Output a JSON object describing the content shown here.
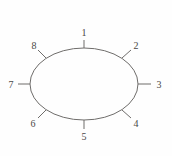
{
  "figure": {
    "name": "labelled-ellipse-diagram",
    "background_color": "#fefefe",
    "stroke_color": "#6f6d6b",
    "label_color": "#4a4846",
    "ellipse": {
      "center_x": 84,
      "center_y": 84,
      "radius_x": 54,
      "radius_y": 36,
      "stroke_width": 1,
      "fill": "none"
    },
    "labels": [
      {
        "id": "1",
        "text": "1",
        "angle_deg": 90,
        "position": "top",
        "label_x": 84,
        "label_y": 33,
        "tick": {
          "x1": 84,
          "y1": 48,
          "x2": 84,
          "y2": 40
        }
      },
      {
        "id": "2",
        "text": "2",
        "angle_deg": 45,
        "position": "upper-right",
        "label_x": 136,
        "label_y": 46,
        "tick": {
          "x1": 122,
          "y1": 58,
          "x2": 131,
          "y2": 50
        }
      },
      {
        "id": "3",
        "text": "3",
        "angle_deg": 0,
        "position": "right",
        "label_x": 159,
        "label_y": 85,
        "tick": {
          "x1": 138,
          "y1": 84,
          "x2": 151,
          "y2": 84
        }
      },
      {
        "id": "4",
        "text": "4",
        "angle_deg": -45,
        "position": "lower-right",
        "label_x": 136,
        "label_y": 124,
        "tick": {
          "x1": 122,
          "y1": 110,
          "x2": 131,
          "y2": 118
        }
      },
      {
        "id": "5",
        "text": "5",
        "angle_deg": -90,
        "position": "bottom",
        "label_x": 84,
        "label_y": 137,
        "tick": {
          "x1": 84,
          "y1": 120,
          "x2": 84,
          "y2": 129
        }
      },
      {
        "id": "6",
        "text": "6",
        "angle_deg": -135,
        "position": "lower-left",
        "label_x": 33,
        "label_y": 124,
        "tick": {
          "x1": 46,
          "y1": 110,
          "x2": 38,
          "y2": 118
        }
      },
      {
        "id": "7",
        "text": "7",
        "angle_deg": 180,
        "position": "left",
        "label_x": 11,
        "label_y": 85,
        "tick": {
          "x1": 30,
          "y1": 84,
          "x2": 18,
          "y2": 84
        }
      },
      {
        "id": "8",
        "text": "8",
        "angle_deg": 135,
        "position": "upper-left",
        "label_x": 34,
        "label_y": 46,
        "tick": {
          "x1": 46,
          "y1": 58,
          "x2": 38,
          "y2": 50
        }
      }
    ]
  }
}
